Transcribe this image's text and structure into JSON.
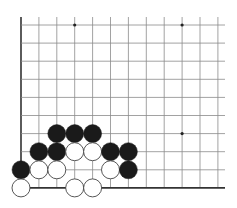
{
  "board": {
    "origin_x": 21,
    "origin_y": 25,
    "spacing_x": 17.9,
    "spacing_y": 18.1,
    "cols": 12,
    "rows": 10,
    "right_extent": 225,
    "line_color": "#8a8a8a",
    "edge_color": "#333333",
    "edge_left": true,
    "edge_bottom": true,
    "stone_radius": 9,
    "black_color": "#1a1a1a",
    "white_fill": "#ffffff",
    "white_stroke": "#444444",
    "star_points": [
      [
        3,
        0
      ],
      [
        9,
        0
      ],
      [
        9,
        6
      ]
    ],
    "stones": [
      {
        "color": "black",
        "col": 2,
        "row": 6
      },
      {
        "color": "black",
        "col": 3,
        "row": 6
      },
      {
        "color": "black",
        "col": 4,
        "row": 6
      },
      {
        "color": "black",
        "col": 1,
        "row": 7
      },
      {
        "color": "black",
        "col": 2,
        "row": 7
      },
      {
        "color": "white",
        "col": 3,
        "row": 7
      },
      {
        "color": "white",
        "col": 4,
        "row": 7
      },
      {
        "color": "black",
        "col": 5,
        "row": 7
      },
      {
        "color": "black",
        "col": 6,
        "row": 7
      },
      {
        "color": "black",
        "col": 0,
        "row": 8
      },
      {
        "color": "white",
        "col": 1,
        "row": 8
      },
      {
        "color": "white",
        "col": 2,
        "row": 8
      },
      {
        "color": "white",
        "col": 5,
        "row": 8
      },
      {
        "color": "black",
        "col": 6,
        "row": 8
      },
      {
        "color": "white",
        "col": 0,
        "row": 9
      },
      {
        "color": "white",
        "col": 3,
        "row": 9
      },
      {
        "color": "white",
        "col": 4,
        "row": 9
      }
    ]
  }
}
